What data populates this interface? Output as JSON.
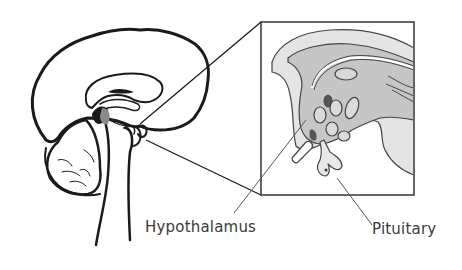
{
  "diagram": {
    "labels": {
      "hypothalamus": "Hypothalamus",
      "pituitary": "Pituitary"
    },
    "colors": {
      "line": "#1a1a1a",
      "inset_light": "#e2e2e2",
      "inset_mid": "#c4c4c4",
      "inset_dark": "#555555",
      "hypothalamus_highlight": "#8a8a8a",
      "text": "#3a3a3a"
    }
  }
}
